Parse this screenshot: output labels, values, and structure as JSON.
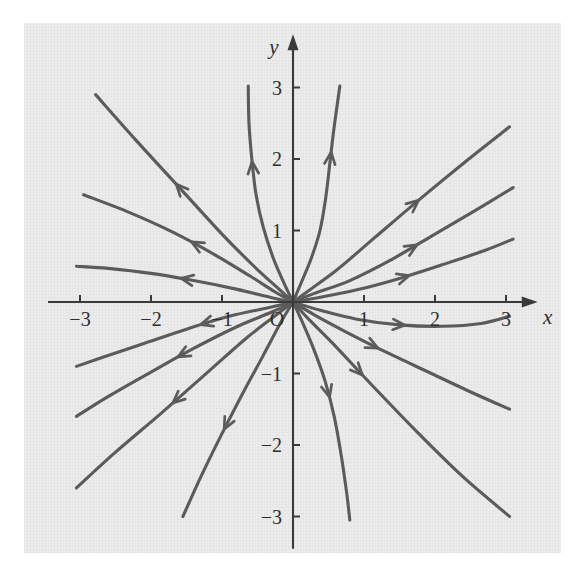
{
  "figure": {
    "kind": "phase-portrait",
    "background_color": "#ebeceb",
    "page_color": "#ffffff",
    "curve_color": "#5b5b5b",
    "axis_color": "#3a3a3a"
  },
  "axes": {
    "x_label": "x",
    "y_label": "y",
    "origin_label": "O",
    "x_ticks": [
      {
        "value": -3,
        "label": "−3"
      },
      {
        "value": -2,
        "label": "−2"
      },
      {
        "value": -1,
        "label": "−1"
      },
      {
        "value": 1,
        "label": "1"
      },
      {
        "value": 2,
        "label": "2"
      },
      {
        "value": 3,
        "label": "3"
      }
    ],
    "y_ticks": [
      {
        "value": 3,
        "label": "3"
      },
      {
        "value": 2,
        "label": "2"
      },
      {
        "value": 1,
        "label": "1"
      },
      {
        "value": -1,
        "label": "−1"
      },
      {
        "value": -2,
        "label": "−2"
      },
      {
        "value": -3,
        "label": "−3"
      }
    ]
  },
  "chart_data": {
    "type": "line",
    "title": "",
    "subtitle": "",
    "xlabel": "x",
    "ylabel": "y",
    "xlim": [
      -3.6,
      3.6
    ],
    "ylim": [
      -3.6,
      3.6
    ],
    "grid": false,
    "legend": "none",
    "annotations": [
      {
        "text": "O",
        "x": -0.22,
        "y": -0.26
      },
      {
        "text": "x",
        "x": 3.38,
        "y": -0.26
      },
      {
        "text": "y",
        "x": -0.27,
        "y": 3.45
      }
    ],
    "flow_direction": "outward from origin (unstable node / source)",
    "equilibrium_points": [
      {
        "x": 0,
        "y": 0,
        "type": "unstable node"
      }
    ],
    "series": [
      {
        "name": "trajectory-q2-vertical",
        "quadrant": "upper-left",
        "arrow_direction": "outward",
        "points": [
          [
            0,
            0
          ],
          [
            -0.12,
            0.25
          ],
          [
            -0.28,
            0.62
          ],
          [
            -0.42,
            1.05
          ],
          [
            -0.52,
            1.5
          ],
          [
            -0.58,
            2.0
          ],
          [
            -0.62,
            2.5
          ],
          [
            -0.63,
            3.02
          ]
        ]
      },
      {
        "name": "trajectory-q2-steep",
        "quadrant": "upper-left",
        "arrow_direction": "outward",
        "points": [
          [
            0,
            0
          ],
          [
            -0.22,
            0.2
          ],
          [
            -0.55,
            0.5
          ],
          [
            -1.0,
            0.95
          ],
          [
            -1.6,
            1.6
          ],
          [
            -2.2,
            2.25
          ],
          [
            -2.78,
            2.9
          ]
        ]
      },
      {
        "name": "trajectory-q2-mid",
        "quadrant": "upper-left",
        "arrow_direction": "outward",
        "points": [
          [
            0,
            0
          ],
          [
            -0.25,
            0.14
          ],
          [
            -0.6,
            0.36
          ],
          [
            -1.1,
            0.66
          ],
          [
            -1.7,
            0.98
          ],
          [
            -2.3,
            1.25
          ],
          [
            -2.95,
            1.5
          ]
        ]
      },
      {
        "name": "trajectory-q2-flat",
        "quadrant": "upper-left",
        "arrow_direction": "outward",
        "points": [
          [
            0,
            0
          ],
          [
            -0.3,
            0.06
          ],
          [
            -0.8,
            0.18
          ],
          [
            -1.4,
            0.3
          ],
          [
            -2.0,
            0.4
          ],
          [
            -2.6,
            0.47
          ],
          [
            -3.05,
            0.5
          ]
        ]
      },
      {
        "name": "trajectory-q1-vertical",
        "quadrant": "upper-right",
        "arrow_direction": "outward",
        "points": [
          [
            0,
            0
          ],
          [
            0.12,
            0.28
          ],
          [
            0.26,
            0.62
          ],
          [
            0.38,
            1.0
          ],
          [
            0.46,
            1.45
          ],
          [
            0.52,
            1.95
          ],
          [
            0.58,
            2.45
          ],
          [
            0.66,
            3.02
          ]
        ]
      },
      {
        "name": "trajectory-q1-steep",
        "quadrant": "upper-right",
        "arrow_direction": "outward",
        "points": [
          [
            0,
            0
          ],
          [
            0.25,
            0.18
          ],
          [
            0.62,
            0.45
          ],
          [
            1.15,
            0.9
          ],
          [
            1.8,
            1.45
          ],
          [
            2.45,
            1.98
          ],
          [
            3.05,
            2.45
          ]
        ]
      },
      {
        "name": "trajectory-q1-mid",
        "quadrant": "upper-right",
        "arrow_direction": "outward",
        "points": [
          [
            0,
            0
          ],
          [
            0.3,
            0.12
          ],
          [
            0.8,
            0.3
          ],
          [
            1.4,
            0.6
          ],
          [
            2.0,
            0.95
          ],
          [
            2.6,
            1.3
          ],
          [
            3.1,
            1.6
          ]
        ]
      },
      {
        "name": "trajectory-q1-flat",
        "quadrant": "upper-right",
        "arrow_direction": "outward",
        "points": [
          [
            0,
            0
          ],
          [
            0.35,
            0.06
          ],
          [
            0.9,
            0.17
          ],
          [
            1.5,
            0.33
          ],
          [
            2.1,
            0.52
          ],
          [
            2.7,
            0.72
          ],
          [
            3.1,
            0.88
          ]
        ]
      },
      {
        "name": "trajectory-q4-flat",
        "quadrant": "lower-right",
        "arrow_direction": "outward",
        "points": [
          [
            0,
            0
          ],
          [
            0.4,
            -0.12
          ],
          [
            0.9,
            -0.24
          ],
          [
            1.5,
            -0.32
          ],
          [
            2.1,
            -0.34
          ],
          [
            2.65,
            -0.3
          ],
          [
            3.05,
            -0.2
          ]
        ]
      },
      {
        "name": "trajectory-q4-mid",
        "quadrant": "lower-right",
        "arrow_direction": "outward",
        "points": [
          [
            0,
            0
          ],
          [
            0.3,
            -0.18
          ],
          [
            0.75,
            -0.42
          ],
          [
            1.35,
            -0.72
          ],
          [
            1.95,
            -1.0
          ],
          [
            2.55,
            -1.28
          ],
          [
            3.05,
            -1.5
          ]
        ]
      },
      {
        "name": "trajectory-q4-steep",
        "quadrant": "lower-right",
        "arrow_direction": "outward",
        "points": [
          [
            0,
            0
          ],
          [
            0.22,
            -0.24
          ],
          [
            0.58,
            -0.6
          ],
          [
            1.1,
            -1.15
          ],
          [
            1.75,
            -1.82
          ],
          [
            2.4,
            -2.45
          ],
          [
            3.05,
            -3.0
          ]
        ]
      },
      {
        "name": "trajectory-q4-vertical",
        "quadrant": "lower-right",
        "arrow_direction": "outward",
        "points": [
          [
            0,
            0
          ],
          [
            0.14,
            -0.3
          ],
          [
            0.3,
            -0.68
          ],
          [
            0.45,
            -1.1
          ],
          [
            0.58,
            -1.6
          ],
          [
            0.68,
            -2.15
          ],
          [
            0.76,
            -2.7
          ],
          [
            0.8,
            -3.05
          ]
        ]
      },
      {
        "name": "trajectory-q3-flat",
        "quadrant": "lower-left",
        "arrow_direction": "outward",
        "points": [
          [
            0,
            0
          ],
          [
            -0.35,
            -0.08
          ],
          [
            -0.9,
            -0.2
          ],
          [
            -1.5,
            -0.38
          ],
          [
            -2.1,
            -0.58
          ],
          [
            -2.7,
            -0.78
          ],
          [
            -3.05,
            -0.9
          ]
        ]
      },
      {
        "name": "trajectory-q3-mid",
        "quadrant": "lower-left",
        "arrow_direction": "outward",
        "points": [
          [
            0,
            0
          ],
          [
            -0.3,
            -0.14
          ],
          [
            -0.8,
            -0.35
          ],
          [
            -1.4,
            -0.65
          ],
          [
            -2.0,
            -0.98
          ],
          [
            -2.6,
            -1.32
          ],
          [
            -3.05,
            -1.6
          ]
        ]
      },
      {
        "name": "trajectory-q3-steep",
        "quadrant": "lower-left",
        "arrow_direction": "outward",
        "points": [
          [
            0,
            0
          ],
          [
            -0.26,
            -0.2
          ],
          [
            -0.65,
            -0.5
          ],
          [
            -1.2,
            -0.98
          ],
          [
            -1.85,
            -1.55
          ],
          [
            -2.5,
            -2.1
          ],
          [
            -3.05,
            -2.6
          ]
        ]
      },
      {
        "name": "trajectory-q3-vertical",
        "quadrant": "lower-left",
        "arrow_direction": "outward",
        "points": [
          [
            0,
            0
          ],
          [
            -0.18,
            -0.3
          ],
          [
            -0.42,
            -0.75
          ],
          [
            -0.72,
            -1.3
          ],
          [
            -1.02,
            -1.88
          ],
          [
            -1.3,
            -2.45
          ],
          [
            -1.55,
            -3.0
          ]
        ]
      }
    ]
  }
}
